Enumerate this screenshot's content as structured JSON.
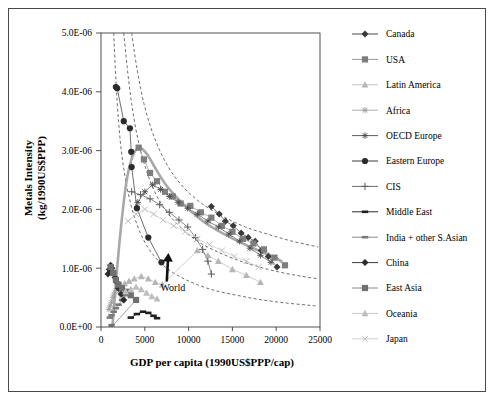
{
  "chart_data": {
    "type": "scatter",
    "title": "",
    "xlabel": "GDP per capita (1990US$PPP/cap)",
    "ylabel_line1": "Metals Intensity",
    "ylabel_line2": "(kg/1990US$PPP)",
    "xlim": [
      0,
      25000
    ],
    "ylim": [
      0,
      5e-06
    ],
    "xticks": [
      0,
      5000,
      10000,
      15000,
      20000,
      25000
    ],
    "xtick_labels": [
      "0",
      "5000",
      "10000",
      "15000",
      "20000",
      "25000"
    ],
    "yticks": [
      0,
      1e-06,
      2e-06,
      3e-06,
      4e-06,
      5e-06
    ],
    "ytick_labels": [
      "0.0E+00",
      "1.0E-06",
      "2.0E-06",
      "3.0E-06",
      "4.0E-06",
      "5.0E-06"
    ],
    "grid": false,
    "legend_position": "right",
    "annotations": [
      {
        "text": "World",
        "x": 8200,
        "y": 6.2e-07,
        "arrow_to_x": 6700,
        "arrow_to_y": 1.05e-06
      }
    ],
    "series": [
      {
        "name": "Canada",
        "marker": "diamond",
        "color": "#3a3a3a",
        "line_color": "#5a5a5a",
        "points": [
          [
            12600,
            2.05e-06
          ],
          [
            13500,
            1.92e-06
          ],
          [
            14200,
            1.8e-06
          ],
          [
            15100,
            1.72e-06
          ],
          [
            16000,
            1.6e-06
          ],
          [
            16800,
            1.52e-06
          ],
          [
            17600,
            1.46e-06
          ],
          [
            18300,
            1.3e-06
          ],
          [
            19100,
            1.2e-06
          ],
          [
            20100,
            1.02e-06
          ]
        ]
      },
      {
        "name": "USA",
        "marker": "square",
        "color": "#7e7e7e",
        "line_color": "#9a9a9a",
        "points": [
          [
            4300,
            3.05e-06
          ],
          [
            4900,
            2.85e-06
          ],
          [
            5600,
            2.62e-06
          ],
          [
            6400,
            2.48e-06
          ],
          [
            7300,
            2.3e-06
          ],
          [
            8200,
            2.22e-06
          ],
          [
            9100,
            2.1e-06
          ],
          [
            10200,
            2.06e-06
          ],
          [
            11400,
            1.95e-06
          ],
          [
            12600,
            1.86e-06
          ],
          [
            13800,
            1.72e-06
          ],
          [
            15000,
            1.62e-06
          ],
          [
            16200,
            1.5e-06
          ],
          [
            17400,
            1.42e-06
          ],
          [
            18600,
            1.32e-06
          ],
          [
            19800,
            1.18e-06
          ],
          [
            21000,
            1.05e-06
          ]
        ]
      },
      {
        "name": "Latin America",
        "marker": "triangle",
        "color": "#b6b6b6",
        "line_color": "#c2c2c2",
        "points": [
          [
            2200,
            7e-07
          ],
          [
            2700,
            7.4e-07
          ],
          [
            3200,
            7.8e-07
          ],
          [
            3800,
            8.2e-07
          ],
          [
            4600,
            8.6e-07
          ],
          [
            5400,
            8.2e-07
          ],
          [
            6200,
            7.6e-07
          ],
          [
            7000,
            7.2e-07
          ],
          [
            11000,
            1.3e-06
          ],
          [
            12200,
            1.22e-06
          ],
          [
            13400,
            1.12e-06
          ],
          [
            15000,
            9.8e-07
          ],
          [
            16600,
            8.8e-07
          ],
          [
            18200,
            7.6e-07
          ]
        ]
      },
      {
        "name": "Africa",
        "marker": "star",
        "color": "#9e9e9e",
        "line_color": "#b0b0b0",
        "points": [
          [
            900,
            3e-07
          ],
          [
            1050,
            3.6e-07
          ],
          [
            1200,
            4.2e-07
          ],
          [
            1350,
            5e-07
          ],
          [
            1500,
            5.6e-07
          ],
          [
            1700,
            6.2e-07
          ],
          [
            1900,
            6.8e-07
          ],
          [
            2100,
            6.2e-07
          ],
          [
            2300,
            5.4e-07
          ],
          [
            2500,
            4.6e-07
          ]
        ]
      },
      {
        "name": "OECD Europe",
        "marker": "star",
        "color": "#4a4a4a",
        "line_color": "#6a6a6a",
        "points": [
          [
            4200,
            2.12e-06
          ],
          [
            5000,
            2.3e-06
          ],
          [
            5900,
            2.42e-06
          ],
          [
            6800,
            2.34e-06
          ],
          [
            7800,
            2.22e-06
          ],
          [
            8800,
            2.12e-06
          ],
          [
            9900,
            2.02e-06
          ],
          [
            11000,
            1.92e-06
          ],
          [
            12200,
            1.8e-06
          ],
          [
            13400,
            1.7e-06
          ],
          [
            14600,
            1.58e-06
          ],
          [
            15800,
            1.46e-06
          ],
          [
            17000,
            1.34e-06
          ],
          [
            18200,
            1.22e-06
          ],
          [
            19400,
            1.1e-06
          ]
        ]
      },
      {
        "name": "Eastern Europe",
        "marker": "circle",
        "color": "#2b2b2b",
        "line_color": "#4a4a4a",
        "points": [
          [
            1700,
            4.08e-06
          ],
          [
            1850,
            4.06e-06
          ],
          [
            2600,
            3.5e-06
          ],
          [
            3300,
            3.38e-06
          ],
          [
            3450,
            2.98e-06
          ],
          [
            3500,
            2.72e-06
          ],
          [
            4100,
            2.02e-06
          ],
          [
            5400,
            1.52e-06
          ],
          [
            6900,
            1.1e-06
          ]
        ]
      },
      {
        "name": "CIS",
        "marker": "plus",
        "color": "#5a5a5a",
        "line_color": "#6e6e6e",
        "points": [
          [
            3500,
            2.3e-06
          ],
          [
            4500,
            2.25e-06
          ],
          [
            5600,
            2.18e-06
          ],
          [
            6700,
            2.08e-06
          ],
          [
            7800,
            1.95e-06
          ],
          [
            8900,
            1.82e-06
          ],
          [
            9900,
            1.7e-06
          ],
          [
            10800,
            1.52e-06
          ],
          [
            11600,
            1.32e-06
          ],
          [
            12200,
            1.12e-06
          ],
          [
            12600,
            9e-07
          ]
        ]
      },
      {
        "name": "Middle East",
        "marker": "dash",
        "color": "#1f1f1f",
        "line_color": "#2b2b2b",
        "points": [
          [
            3400,
            1.6e-07
          ],
          [
            4100,
            2.2e-07
          ],
          [
            4800,
            2.6e-07
          ],
          [
            5400,
            2.4e-07
          ],
          [
            6000,
            1.9e-07
          ],
          [
            6400,
            1.5e-07
          ]
        ]
      },
      {
        "name": "India + other S.Asian",
        "marker": "dash",
        "color": "#7a7a7a",
        "line_color": "#8a8a8a",
        "points": [
          [
            1000,
            1.6e-07
          ],
          [
            1200,
            2e-07
          ],
          [
            1450,
            2.6e-07
          ],
          [
            1700,
            3.2e-07
          ],
          [
            2000,
            3.8e-07
          ],
          [
            2400,
            4.6e-07
          ],
          [
            2800,
            5.4e-07
          ]
        ]
      },
      {
        "name": "China",
        "marker": "diamond",
        "color": "#2b2b2b",
        "line_color": "#4a4a4a",
        "points": [
          [
            800,
            9e-07
          ],
          [
            950,
            9.8e-07
          ],
          [
            1100,
            1.05e-06
          ],
          [
            1250,
            1e-06
          ],
          [
            1400,
            9.2e-07
          ],
          [
            1600,
            8.4e-07
          ],
          [
            1800,
            7.6e-07
          ],
          [
            2000,
            6.6e-07
          ],
          [
            2300,
            5.6e-07
          ],
          [
            2600,
            4.6e-07
          ]
        ]
      },
      {
        "name": "East Asia",
        "marker": "square",
        "color": "#707070",
        "line_color": "#8a8a8a",
        "points": [
          [
            1100,
            1.02e-06
          ],
          [
            1400,
            9.2e-07
          ],
          [
            1700,
            8e-07
          ],
          [
            2000,
            7.2e-07
          ],
          [
            2400,
            6.6e-07
          ],
          [
            2900,
            6e-07
          ],
          [
            3400,
            5.4e-07
          ],
          [
            4000,
            4.6e-07
          ],
          [
            1200,
            0.0
          ]
        ]
      },
      {
        "name": "Oceania",
        "marker": "triangle",
        "color": "#bdbdbd",
        "line_color": "#c8c8c8",
        "points": [
          [
            2800,
            6e-07
          ],
          [
            3400,
            6.4e-07
          ],
          [
            4000,
            6.8e-07
          ],
          [
            4600,
            6.4e-07
          ],
          [
            5200,
            5.8e-07
          ],
          [
            5800,
            5.2e-07
          ],
          [
            6400,
            4.8e-07
          ]
        ]
      },
      {
        "name": "Japan",
        "marker": "cross",
        "color": "#c0c0c0",
        "line_color": "#cfcfcf",
        "points": [
          [
            3100,
            1.8e-06
          ],
          [
            4000,
            1.92e-06
          ],
          [
            5000,
            2e-06
          ],
          [
            6000,
            1.92e-06
          ],
          [
            7100,
            1.82e-06
          ],
          [
            8300,
            1.72e-06
          ],
          [
            9600,
            1.62e-06
          ],
          [
            11000,
            1.5e-06
          ],
          [
            12400,
            1.4e-06
          ],
          [
            13800,
            1.3e-06
          ],
          [
            15200,
            1.2e-06
          ],
          [
            16600,
            1.12e-06
          ],
          [
            18000,
            1.02e-06
          ]
        ]
      }
    ],
    "world_curve": {
      "name": "World",
      "style": "thick-solid",
      "color": "#a8a8a8",
      "points": [
        [
          1300,
          0.0
        ],
        [
          1900,
          1.1e-06
        ],
        [
          2500,
          2e-06
        ],
        [
          3000,
          2.55e-06
        ],
        [
          3600,
          2.9e-06
        ],
        [
          4300,
          3.05e-06
        ],
        [
          5200,
          2.95e-06
        ],
        [
          6200,
          2.7e-06
        ],
        [
          7400,
          2.42e-06
        ],
        [
          8800,
          2.18e-06
        ],
        [
          10400,
          1.95e-06
        ],
        [
          12000,
          1.76e-06
        ],
        [
          13800,
          1.6e-06
        ],
        [
          15600,
          1.46e-06
        ],
        [
          17400,
          1.34e-06
        ],
        [
          19200,
          1.22e-06
        ],
        [
          20600,
          1.12e-06
        ]
      ]
    },
    "reference_curves": [
      {
        "name": "iso-intensity-curve-1",
        "style": "dashed",
        "color": "#555555",
        "points": [
          [
            1450,
            5e-06
          ],
          [
            1700,
            4.2e-06
          ],
          [
            2000,
            3.5e-06
          ],
          [
            2400,
            2.9e-06
          ],
          [
            3000,
            2.35e-06
          ],
          [
            3800,
            1.88e-06
          ],
          [
            4800,
            1.5e-06
          ],
          [
            6000,
            1.22e-06
          ],
          [
            7500,
            1e-06
          ],
          [
            9200,
            8.4e-07
          ],
          [
            11000,
            7.2e-07
          ],
          [
            13000,
            6.2e-07
          ],
          [
            15500,
            5.4e-07
          ],
          [
            18000,
            4.7e-07
          ],
          [
            21000,
            4.1e-07
          ],
          [
            24500,
            3.6e-07
          ]
        ]
      },
      {
        "name": "iso-intensity-curve-2",
        "style": "dashed",
        "color": "#555555",
        "points": [
          [
            2600,
            5e-06
          ],
          [
            3000,
            4.4e-06
          ],
          [
            3500,
            3.8e-06
          ],
          [
            4200,
            3.2e-06
          ],
          [
            5100,
            2.7e-06
          ],
          [
            6200,
            2.28e-06
          ],
          [
            7600,
            1.94e-06
          ],
          [
            9200,
            1.68e-06
          ],
          [
            11000,
            1.46e-06
          ],
          [
            13000,
            1.3e-06
          ],
          [
            15200,
            1.16e-06
          ],
          [
            17600,
            1.04e-06
          ],
          [
            20200,
            9.4e-07
          ],
          [
            23000,
            8.6e-07
          ],
          [
            24800,
            8.2e-07
          ]
        ]
      },
      {
        "name": "iso-intensity-curve-3",
        "style": "dashed",
        "color": "#555555",
        "points": [
          [
            3500,
            5e-06
          ],
          [
            4100,
            4.4e-06
          ],
          [
            4900,
            3.8e-06
          ],
          [
            5900,
            3.3e-06
          ],
          [
            7100,
            2.88e-06
          ],
          [
            8500,
            2.54e-06
          ],
          [
            10200,
            2.26e-06
          ],
          [
            12100,
            2.04e-06
          ],
          [
            14200,
            1.86e-06
          ],
          [
            16500,
            1.7e-06
          ],
          [
            19000,
            1.58e-06
          ],
          [
            21800,
            1.46e-06
          ],
          [
            24800,
            1.36e-06
          ]
        ]
      }
    ]
  },
  "legend": {
    "items": [
      {
        "label": "Canada",
        "marker": "diamond",
        "color": "#3a3a3a",
        "line_color": "#4a4a4a"
      },
      {
        "label": "USA",
        "marker": "square",
        "color": "#7e7e7e",
        "line_color": "#9a9a9a"
      },
      {
        "label": "Latin America",
        "marker": "triangle",
        "color": "#b6b6b6",
        "line_color": "#c4c4c4"
      },
      {
        "label": "Africa",
        "marker": "star",
        "color": "#9e9e9e",
        "line_color": "#b0b0b0"
      },
      {
        "label": "OECD Europe",
        "marker": "star",
        "color": "#4a4a4a",
        "line_color": "#5e5e5e"
      },
      {
        "label": "Eastern Europe",
        "marker": "circle",
        "color": "#2b2b2b",
        "line_color": "#3a3a3a"
      },
      {
        "label": "CIS",
        "marker": "plus",
        "color": "#5a5a5a",
        "line_color": "#6e6e6e"
      },
      {
        "label": "Middle East",
        "marker": "dash",
        "color": "#1f1f1f",
        "line_color": "#2b2b2b"
      },
      {
        "label": "India + other S.Asian",
        "marker": "dash",
        "color": "#7a7a7a",
        "line_color": "#8a8a8a"
      },
      {
        "label": "China",
        "marker": "diamond",
        "color": "#2b2b2b",
        "line_color": "#3a3a3a"
      },
      {
        "label": "East Asia",
        "marker": "square",
        "color": "#707070",
        "line_color": "#8a8a8a"
      },
      {
        "label": "Oceania",
        "marker": "triangle",
        "color": "#bdbdbd",
        "line_color": "#c8c8c8"
      },
      {
        "label": "Japan",
        "marker": "cross",
        "color": "#c0c0c0",
        "line_color": "#cfcfcf"
      }
    ]
  }
}
